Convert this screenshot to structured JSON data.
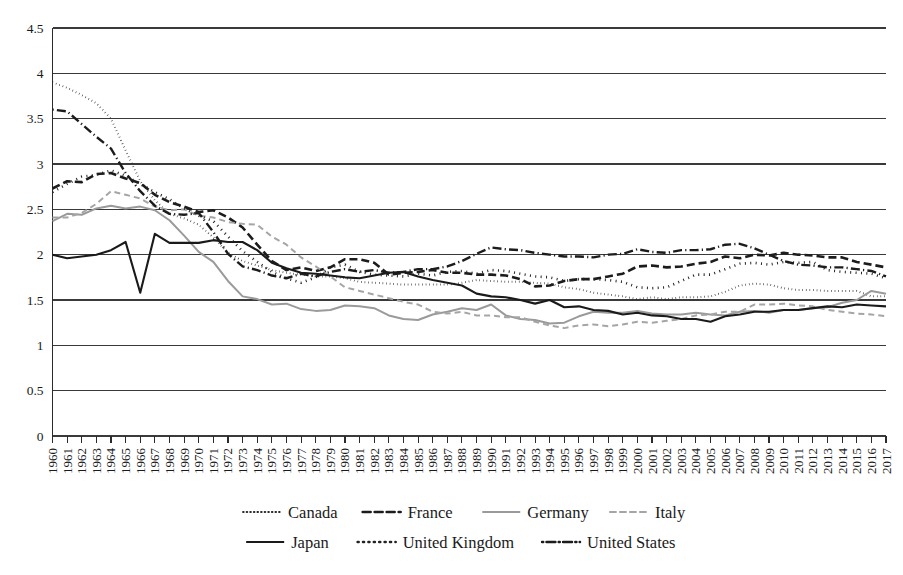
{
  "chart_data": {
    "type": "line",
    "title": "",
    "subtitle": "",
    "xlabel": "",
    "ylabel": "",
    "ylim": [
      0,
      4.5
    ],
    "xlim": [
      1960,
      2017
    ],
    "y_ticks": [
      "0",
      "0.5",
      "1",
      "1.5",
      "2",
      "2.5",
      "3",
      "3.5",
      "4",
      "4.5"
    ],
    "y_tick_values": [
      0,
      0.5,
      1,
      1.5,
      2,
      2.5,
      3,
      3.5,
      4,
      4.5
    ],
    "grid": true,
    "grid_axis": "y",
    "legend_position": "bottom",
    "x": [
      1960,
      1961,
      1962,
      1963,
      1964,
      1965,
      1966,
      1967,
      1968,
      1969,
      1970,
      1971,
      1972,
      1973,
      1974,
      1975,
      1976,
      1977,
      1978,
      1979,
      1980,
      1981,
      1982,
      1983,
      1984,
      1985,
      1986,
      1987,
      1988,
      1989,
      1990,
      1991,
      1992,
      1993,
      1994,
      1995,
      1996,
      1997,
      1998,
      1999,
      2000,
      2001,
      2002,
      2003,
      2004,
      2005,
      2006,
      2007,
      2008,
      2009,
      2010,
      2011,
      2012,
      2013,
      2014,
      2015,
      2016,
      2017
    ],
    "categories": [
      "1960",
      "1961",
      "1962",
      "1963",
      "1964",
      "1965",
      "1966",
      "1967",
      "1968",
      "1969",
      "1970",
      "1971",
      "1972",
      "1973",
      "1974",
      "1975",
      "1976",
      "1977",
      "1978",
      "1979",
      "1980",
      "1981",
      "1982",
      "1983",
      "1984",
      "1985",
      "1986",
      "1987",
      "1988",
      "1989",
      "1990",
      "1991",
      "1992",
      "1993",
      "1994",
      "1995",
      "1996",
      "1997",
      "1998",
      "1999",
      "2000",
      "2001",
      "2002",
      "2003",
      "2004",
      "2005",
      "2006",
      "2007",
      "2008",
      "2009",
      "2010",
      "2011",
      "2012",
      "2013",
      "2014",
      "2015",
      "2016",
      "2017"
    ],
    "series": [
      {
        "name": "Canada",
        "style": "fine-dotted",
        "color": "#2a2a2a",
        "width": 2.0,
        "dash": "0.6,3.0",
        "values": [
          3.9,
          3.84,
          3.76,
          3.67,
          3.5,
          3.15,
          2.81,
          2.6,
          2.45,
          2.4,
          2.33,
          2.19,
          2.02,
          1.93,
          1.88,
          1.83,
          1.8,
          1.78,
          1.76,
          1.76,
          1.74,
          1.7,
          1.69,
          1.68,
          1.67,
          1.67,
          1.67,
          1.67,
          1.69,
          1.72,
          1.71,
          1.7,
          1.7,
          1.69,
          1.68,
          1.64,
          1.62,
          1.58,
          1.56,
          1.54,
          1.51,
          1.53,
          1.51,
          1.53,
          1.53,
          1.54,
          1.59,
          1.66,
          1.68,
          1.67,
          1.63,
          1.61,
          1.61,
          1.6,
          1.6,
          1.6,
          1.54,
          1.54
        ]
      },
      {
        "name": "France",
        "style": "bold-dashed",
        "color": "#1c1c1c",
        "width": 2.6,
        "dash": "8,4",
        "values": [
          2.73,
          2.81,
          2.8,
          2.89,
          2.9,
          2.84,
          2.79,
          2.66,
          2.58,
          2.53,
          2.47,
          2.49,
          2.41,
          2.3,
          2.11,
          1.93,
          1.83,
          1.86,
          1.82,
          1.86,
          1.95,
          1.95,
          1.91,
          1.78,
          1.8,
          1.81,
          1.83,
          1.8,
          1.8,
          1.78,
          1.78,
          1.77,
          1.73,
          1.65,
          1.66,
          1.71,
          1.73,
          1.73,
          1.76,
          1.79,
          1.87,
          1.88,
          1.86,
          1.87,
          1.9,
          1.92,
          1.98,
          1.96,
          2.0,
          1.99,
          2.02,
          2.0,
          1.99,
          1.97,
          1.97,
          1.92,
          1.89,
          1.86
        ]
      },
      {
        "name": "Germany",
        "style": "solid-gray",
        "color": "#9a9a9a",
        "width": 2.0,
        "dash": "none",
        "values": [
          2.37,
          2.45,
          2.44,
          2.51,
          2.54,
          2.51,
          2.53,
          2.49,
          2.38,
          2.21,
          2.03,
          1.92,
          1.71,
          1.54,
          1.51,
          1.45,
          1.46,
          1.4,
          1.38,
          1.39,
          1.44,
          1.43,
          1.41,
          1.33,
          1.29,
          1.28,
          1.34,
          1.37,
          1.41,
          1.39,
          1.45,
          1.33,
          1.29,
          1.28,
          1.24,
          1.25,
          1.32,
          1.37,
          1.36,
          1.36,
          1.38,
          1.35,
          1.34,
          1.34,
          1.36,
          1.34,
          1.33,
          1.37,
          1.38,
          1.36,
          1.39,
          1.39,
          1.41,
          1.42,
          1.47,
          1.5,
          1.6,
          1.57
        ]
      },
      {
        "name": "Italy",
        "style": "gray-dashed",
        "color": "#a5a5a5",
        "width": 2.0,
        "dash": "6,4",
        "values": [
          2.41,
          2.41,
          2.46,
          2.56,
          2.7,
          2.66,
          2.62,
          2.53,
          2.49,
          2.5,
          2.43,
          2.41,
          2.36,
          2.34,
          2.33,
          2.2,
          2.11,
          1.97,
          1.87,
          1.76,
          1.64,
          1.6,
          1.56,
          1.52,
          1.48,
          1.45,
          1.37,
          1.35,
          1.37,
          1.33,
          1.33,
          1.31,
          1.31,
          1.26,
          1.22,
          1.19,
          1.22,
          1.23,
          1.21,
          1.23,
          1.26,
          1.25,
          1.27,
          1.29,
          1.33,
          1.34,
          1.37,
          1.37,
          1.45,
          1.45,
          1.46,
          1.44,
          1.43,
          1.39,
          1.37,
          1.35,
          1.34,
          1.32
        ]
      },
      {
        "name": "Japan",
        "style": "solid-black",
        "color": "#1a1a1a",
        "width": 2.1,
        "dash": "none",
        "values": [
          2.0,
          1.96,
          1.98,
          2.0,
          2.05,
          2.14,
          1.58,
          2.23,
          2.13,
          2.13,
          2.13,
          2.16,
          2.14,
          2.14,
          2.05,
          1.91,
          1.85,
          1.8,
          1.79,
          1.77,
          1.75,
          1.74,
          1.77,
          1.8,
          1.81,
          1.76,
          1.72,
          1.69,
          1.66,
          1.57,
          1.54,
          1.53,
          1.5,
          1.46,
          1.5,
          1.42,
          1.43,
          1.39,
          1.38,
          1.34,
          1.36,
          1.33,
          1.32,
          1.29,
          1.29,
          1.26,
          1.32,
          1.34,
          1.37,
          1.37,
          1.39,
          1.39,
          1.41,
          1.43,
          1.42,
          1.45,
          1.44,
          1.43
        ]
      },
      {
        "name": "United Kingdom",
        "style": "coarse-dotted",
        "color": "#222222",
        "width": 2.6,
        "dash": "1.0,4.4",
        "values": [
          2.69,
          2.78,
          2.86,
          2.88,
          2.93,
          2.87,
          2.78,
          2.69,
          2.61,
          2.51,
          2.43,
          2.37,
          2.2,
          2.04,
          1.92,
          1.81,
          1.74,
          1.69,
          1.75,
          1.86,
          1.89,
          1.81,
          1.78,
          1.77,
          1.76,
          1.79,
          1.77,
          1.81,
          1.82,
          1.79,
          1.83,
          1.82,
          1.79,
          1.76,
          1.75,
          1.71,
          1.73,
          1.73,
          1.72,
          1.7,
          1.64,
          1.63,
          1.64,
          1.71,
          1.78,
          1.78,
          1.84,
          1.9,
          1.91,
          1.89,
          1.92,
          1.91,
          1.92,
          1.83,
          1.81,
          1.8,
          1.79,
          1.74
        ]
      },
      {
        "name": "United States",
        "style": "dash-dot",
        "color": "#1c1c1c",
        "width": 2.4,
        "dash": "1.2,3.2,9,3.2",
        "values": [
          3.6,
          3.58,
          3.44,
          3.3,
          3.17,
          2.9,
          2.7,
          2.54,
          2.45,
          2.44,
          2.46,
          2.25,
          2.01,
          1.87,
          1.83,
          1.77,
          1.74,
          1.79,
          1.76,
          1.81,
          1.84,
          1.81,
          1.83,
          1.8,
          1.81,
          1.84,
          1.84,
          1.87,
          1.93,
          2.01,
          2.08,
          2.06,
          2.05,
          2.02,
          2.0,
          1.98,
          1.98,
          1.97,
          2.0,
          2.01,
          2.06,
          2.03,
          2.02,
          2.05,
          2.05,
          2.06,
          2.11,
          2.12,
          2.07,
          2.0,
          1.93,
          1.89,
          1.88,
          1.86,
          1.86,
          1.84,
          1.82,
          1.76
        ]
      }
    ]
  },
  "legend": {
    "rows": [
      [
        {
          "name": "Canada",
          "key": "canada"
        },
        {
          "name": "France",
          "key": "france"
        },
        {
          "name": "Germany",
          "key": "germany"
        },
        {
          "name": "Italy",
          "key": "italy"
        }
      ],
      [
        {
          "name": "Japan",
          "key": "japan"
        },
        {
          "name": "United Kingdom",
          "key": "united-kingdom"
        },
        {
          "name": "United States",
          "key": "united-states"
        }
      ]
    ]
  }
}
